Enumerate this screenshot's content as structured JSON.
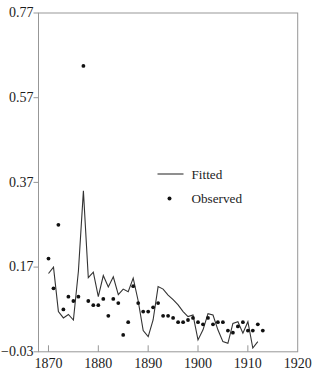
{
  "figure": {
    "background": "#ffffff"
  },
  "chart_data": {
    "type": "line+scatter",
    "title": "",
    "xlabel": "",
    "ylabel": "",
    "xlim": [
      1868,
      1920
    ],
    "ylim": [
      -0.03,
      0.77
    ],
    "x_ticks": [
      1870,
      1880,
      1890,
      1900,
      1910,
      1920
    ],
    "x_tick_labels": [
      "1870",
      "1880",
      "1890",
      "1900",
      "1910",
      "1920"
    ],
    "y_ticks": [
      -0.03,
      0.17,
      0.37,
      0.57,
      0.77
    ],
    "y_tick_labels": [
      "−0.03",
      "0.17",
      "0.37",
      "0.57",
      "0.77"
    ],
    "grid": false,
    "frame": true,
    "legend_position": "inside-upper-center",
    "axis_color": "#979797",
    "text_color": "#1c1c1c",
    "x": [
      1870,
      1871,
      1872,
      1873,
      1874,
      1875,
      1876,
      1877,
      1878,
      1879,
      1880,
      1881,
      1882,
      1883,
      1884,
      1885,
      1886,
      1887,
      1888,
      1889,
      1890,
      1891,
      1892,
      1893,
      1894,
      1895,
      1896,
      1897,
      1898,
      1899,
      1900,
      1901,
      1902,
      1903,
      1904,
      1905,
      1906,
      1907,
      1908,
      1909,
      1910,
      1911,
      1912,
      1913
    ],
    "series": [
      {
        "name": "Fitted",
        "type": "line",
        "color": "#333333",
        "values": [
          0.155,
          0.17,
          0.065,
          0.05,
          0.058,
          0.045,
          0.16,
          0.35,
          0.145,
          0.158,
          0.1,
          0.15,
          0.123,
          0.147,
          0.105,
          0.118,
          0.112,
          0.144,
          0.09,
          0.02,
          0.006,
          0.045,
          0.124,
          0.118,
          0.104,
          0.093,
          0.081,
          0.065,
          0.053,
          0.057,
          -0.002,
          0.022,
          0.06,
          0.057,
          0.022,
          -0.006,
          -0.01,
          0.037,
          0.041,
          0.014,
          0.041,
          -0.021,
          -0.006,
          null
        ]
      },
      {
        "name": "Observed",
        "type": "scatter",
        "color": "#111111",
        "values": [
          0.19,
          0.12,
          0.27,
          0.07,
          0.1,
          0.09,
          0.1,
          0.645,
          0.09,
          0.08,
          0.08,
          0.095,
          0.055,
          0.095,
          0.085,
          0.01,
          0.04,
          0.125,
          0.085,
          0.065,
          0.065,
          0.075,
          0.085,
          0.055,
          0.055,
          0.05,
          0.04,
          0.04,
          0.045,
          0.05,
          0.04,
          0.035,
          0.05,
          0.035,
          0.04,
          0.04,
          0.02,
          0.015,
          0.03,
          0.04,
          0.02,
          0.02,
          0.035,
          0.02
        ]
      }
    ]
  }
}
